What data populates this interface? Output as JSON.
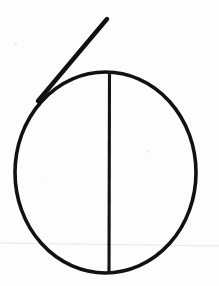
{
  "figure": {
    "medium": "ink drawing on paper",
    "canvas": {
      "width": 219,
      "height": 286,
      "background_color": "#fdfdfd"
    },
    "ink_color": "#111111",
    "shapes": [
      {
        "id": "circle-outline",
        "name": "circle",
        "type": "ellipse",
        "center_x": 105.5,
        "center_y": 172.5,
        "radius_x": 90.5,
        "radius_y": 100.5,
        "stroke_width": 3.6,
        "stroke_color": "#111111",
        "fill": "none"
      },
      {
        "id": "vertical-diameter",
        "name": "vertical diameter line",
        "type": "line",
        "x1": 109.5,
        "y1": 72.5,
        "x2": 109.0,
        "y2": 273.5,
        "stroke_width": 3.1,
        "stroke_color": "#141414"
      },
      {
        "id": "diagonal-stroke",
        "name": "diagonal stroke",
        "type": "line",
        "x1": 107.0,
        "y1": 19.0,
        "x2": 38.0,
        "y2": 101.0,
        "stroke_width": 4.4,
        "stroke_color": "#111111",
        "angle_degrees": 130
      },
      {
        "id": "paper-crease",
        "name": "faint horizontal paper crease",
        "type": "line",
        "x1": 0.0,
        "y1": 243.0,
        "x2": 219.0,
        "y2": 246.0,
        "stroke_width": 1.1,
        "stroke_color": "#e8e8e8"
      }
    ],
    "annotations": {
      "diagonal_crosses_arc_at_x": 46,
      "diagonal_crosses_arc_at_y": 92,
      "circle_top_y": 72,
      "circle_bottom_y": 273,
      "circle_left_x": 15,
      "circle_right_x": 196
    }
  }
}
